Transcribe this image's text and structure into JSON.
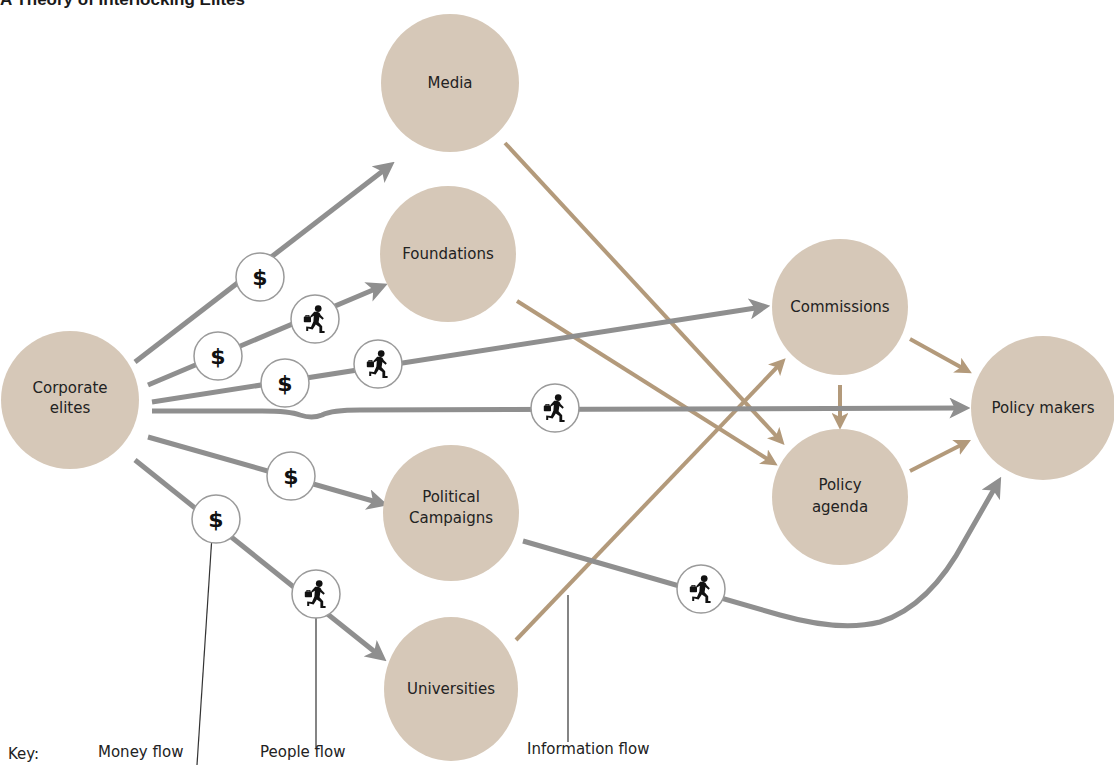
{
  "title": "A Theory of Interlocking Elites",
  "colors": {
    "node_fill": "#d6c8b8",
    "gray_flow": "#8f8f8f",
    "info_flow": "#b39a7b",
    "badge_stroke": "#9a9a9a",
    "text": "#222222",
    "leader_line": "#333333"
  },
  "nodes": [
    {
      "id": "corporate",
      "lines": [
        "Corporate",
        "elites"
      ]
    },
    {
      "id": "media",
      "lines": [
        "Media"
      ]
    },
    {
      "id": "foundations",
      "lines": [
        "Foundations"
      ]
    },
    {
      "id": "political",
      "lines": [
        "Political",
        "Campaigns"
      ]
    },
    {
      "id": "universities",
      "lines": [
        "Universities"
      ]
    },
    {
      "id": "commissions",
      "lines": [
        "Commissions"
      ]
    },
    {
      "id": "agenda",
      "lines": [
        "Policy",
        "agenda"
      ]
    },
    {
      "id": "makers",
      "lines": [
        "Policy makers"
      ]
    }
  ],
  "flows": [
    {
      "from": "corporate",
      "to": "media",
      "type": "money",
      "badges": [
        "money"
      ]
    },
    {
      "from": "corporate",
      "to": "foundations",
      "type": "money",
      "badges": [
        "money",
        "people"
      ]
    },
    {
      "from": "corporate",
      "to": "commissions",
      "type": "money",
      "badges": [
        "money",
        "people"
      ]
    },
    {
      "from": "corporate",
      "to": "makers",
      "type": "people",
      "badges": [
        "people"
      ]
    },
    {
      "from": "corporate",
      "to": "political",
      "type": "money",
      "badges": [
        "money"
      ]
    },
    {
      "from": "corporate",
      "to": "universities",
      "type": "money",
      "badges": [
        "money",
        "people"
      ]
    },
    {
      "from": "political",
      "to": "makers",
      "type": "people",
      "badges": [
        "people"
      ]
    },
    {
      "from": "media",
      "to": "agenda",
      "type": "information",
      "badges": []
    },
    {
      "from": "foundations",
      "to": "agenda",
      "type": "information",
      "badges": []
    },
    {
      "from": "universities",
      "to": "commissions",
      "type": "information",
      "badges": []
    },
    {
      "from": "commissions",
      "to": "agenda",
      "type": "information",
      "badges": []
    },
    {
      "from": "commissions",
      "to": "makers",
      "type": "information",
      "badges": []
    },
    {
      "from": "agenda",
      "to": "makers",
      "type": "information",
      "badges": []
    }
  ],
  "badges": {
    "money": {
      "icon": "dollar-sign-icon",
      "glyph": "$"
    },
    "people": {
      "icon": "running-man-briefcase-icon",
      "glyph": ""
    }
  },
  "key": {
    "label": "Key:",
    "items": [
      {
        "id": "money",
        "label": "Money flow"
      },
      {
        "id": "people",
        "label": "People flow"
      },
      {
        "id": "information",
        "label": "Information flow"
      }
    ]
  }
}
